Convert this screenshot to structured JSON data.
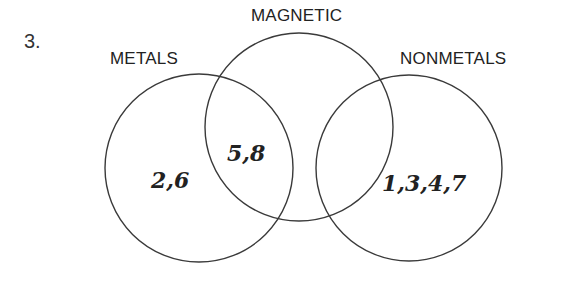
{
  "question_number": "3.",
  "sets": {
    "metals": {
      "label": "METALS"
    },
    "magnetic": {
      "label": "MAGNETIC"
    },
    "nonmetals": {
      "label": "NONMETALS"
    }
  },
  "regions": {
    "metals_only": "2,6",
    "metals_and_magnetic": "5,8",
    "nonmetals_only": "1,3,4,7"
  },
  "colors": {
    "stroke": "#3a3a3a",
    "text": "#222222",
    "background": "#ffffff"
  }
}
